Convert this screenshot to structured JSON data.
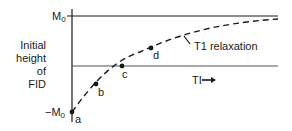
{
  "diagram": {
    "y_axis_label": [
      "Initial",
      "height",
      "of",
      "FID"
    ],
    "y_ticks": {
      "top": {
        "main": "M",
        "sub": "0"
      },
      "bottom": {
        "main": "−M",
        "sub": "0"
      }
    },
    "x_axis_label": "TI",
    "x_axis_arrow": "→",
    "curve_label": "T1 relaxation",
    "points": [
      {
        "id": "a",
        "label": "a"
      },
      {
        "id": "b",
        "label": "b"
      },
      {
        "id": "c",
        "label": "c"
      },
      {
        "id": "d",
        "label": "d"
      }
    ],
    "colors": {
      "line": "#1a1a1a",
      "zero_line": "#555555",
      "background": "#ffffff"
    }
  }
}
